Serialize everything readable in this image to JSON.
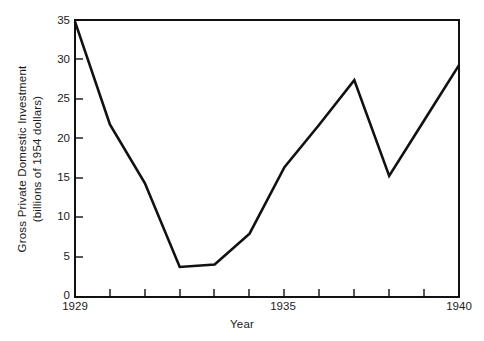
{
  "chart_data": {
    "type": "line",
    "title": "",
    "xlabel": "Year",
    "ylabel": "Gross Private Domestic Investment (billions of 1954 dollars)",
    "ylabel_line1": "Gross Private Domestic Investment",
    "ylabel_line2": "(billions of 1954 dollars)",
    "x": [
      1929,
      1930,
      1931,
      1932,
      1933,
      1934,
      1935,
      1936,
      1937,
      1938,
      1939,
      1940
    ],
    "values": [
      34.8,
      21.8,
      14.4,
      3.8,
      4.1,
      8.0,
      16.4,
      21.8,
      27.4,
      15.3,
      22.3,
      29.3
    ],
    "xlim": [
      1929,
      1940
    ],
    "ylim": [
      0,
      35
    ],
    "grid": false,
    "legend": false,
    "y_ticks": [
      0,
      5,
      10,
      15,
      20,
      25,
      30,
      35
    ],
    "y_tick_labels": [
      "0",
      "5",
      "10",
      "15",
      "20",
      "25",
      "30",
      "35"
    ],
    "x_ticks": [
      1929,
      1930,
      1931,
      1932,
      1933,
      1934,
      1935,
      1936,
      1937,
      1938,
      1939,
      1940
    ],
    "x_tick_labels": [
      "1929",
      "",
      "",
      "",
      "",
      "",
      "1935",
      "",
      "",
      "",
      "",
      "1940"
    ],
    "x_labeled_ticks": [
      {
        "year": "1929",
        "x": 1929
      },
      {
        "year": "1935",
        "x": 1935
      },
      {
        "year": "1940",
        "x": 1940
      }
    ],
    "series_color": "#111111"
  }
}
